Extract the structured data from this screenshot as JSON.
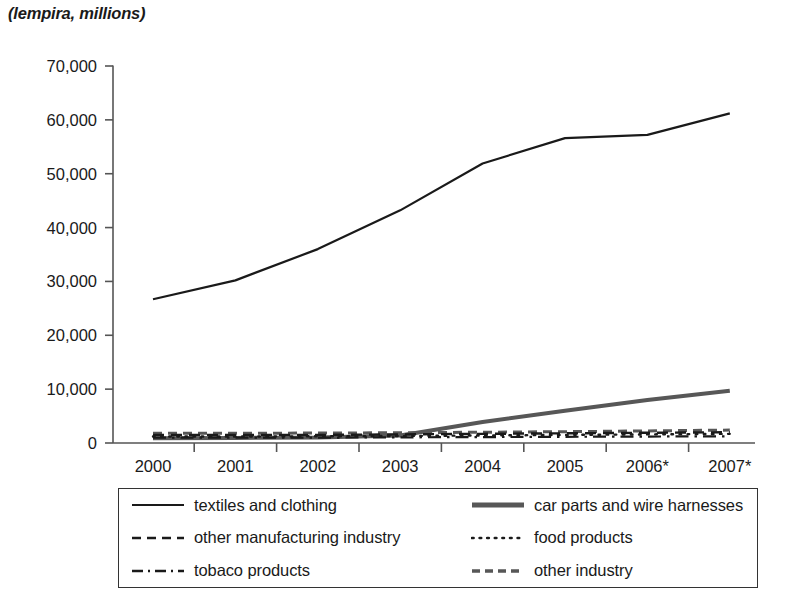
{
  "chart_data": {
    "type": "line",
    "title": "(lempira, millions)",
    "xlabel": "",
    "ylabel": "(lempira, millions)",
    "categories": [
      "2000",
      "2001",
      "2002",
      "2003",
      "2004",
      "2005",
      "2006*",
      "2007*"
    ],
    "ylim": [
      0,
      70000
    ],
    "ytick_labels": [
      "0",
      "10,000",
      "20,000",
      "30,000",
      "40,000",
      "50,000",
      "60,000",
      "70,000"
    ],
    "ytick_values": [
      0,
      10000,
      20000,
      30000,
      40000,
      50000,
      60000,
      70000
    ],
    "grid": false,
    "legend_position": "below-plot",
    "series": [
      {
        "name": "textiles and clothing",
        "style": "solid",
        "color": "#1a1a1a",
        "width": 2.2,
        "values": [
          26700,
          30200,
          36000,
          43200,
          51900,
          56600,
          57200,
          61200
        ]
      },
      {
        "name": "car parts and wire harnesses",
        "style": "solid-thick",
        "color": "#575757",
        "width": 4.0,
        "values": [
          900,
          950,
          1000,
          1400,
          3900,
          6000,
          8000,
          9700
        ]
      },
      {
        "name": "other manufacturing industry",
        "style": "dashed",
        "color": "#1a1a1a",
        "width": 2.4,
        "values": [
          1500,
          1500,
          1500,
          1600,
          1700,
          1800,
          1900,
          2000
        ]
      },
      {
        "name": "food products",
        "style": "dotted",
        "color": "#1a1a1a",
        "width": 2.4,
        "values": [
          1200,
          1200,
          1250,
          1300,
          1400,
          1500,
          1600,
          1700
        ]
      },
      {
        "name": "tobaco products",
        "style": "dash-dot",
        "color": "#1a1a1a",
        "width": 2.2,
        "values": [
          1000,
          1000,
          1000,
          1050,
          1100,
          1150,
          1200,
          1250
        ]
      },
      {
        "name": "other industry",
        "style": "dashed-short",
        "color": "#575757",
        "width": 3.0,
        "values": [
          1800,
          1800,
          1850,
          1900,
          2000,
          2100,
          2250,
          2400
        ]
      }
    ]
  },
  "legend": {
    "entries": [
      {
        "label": "textiles and clothing",
        "style": "solid",
        "color": "#1a1a1a"
      },
      {
        "label": "car parts and wire harnesses",
        "style": "solid-thick",
        "color": "#575757"
      },
      {
        "label": "other manufacturing industry",
        "style": "dashed",
        "color": "#1a1a1a"
      },
      {
        "label": "food products",
        "style": "dotted",
        "color": "#1a1a1a"
      },
      {
        "label": "tobaco products",
        "style": "dash-dot",
        "color": "#1a1a1a"
      },
      {
        "label": "other industry",
        "style": "dashed-short",
        "color": "#575757"
      }
    ]
  },
  "axis": {
    "line_color": "#555555"
  }
}
